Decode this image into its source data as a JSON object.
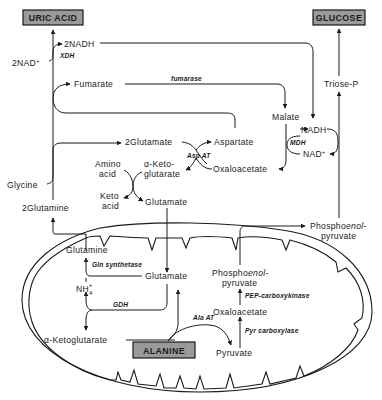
{
  "diagram": {
    "products": {
      "uric_acid": "URIC ACID",
      "glucose": "GLUCOSE",
      "alanine": "ALANINE"
    },
    "cytosol": {
      "nadh_2": "2NADH",
      "nad_2": "2NAD",
      "nad_sup": "+",
      "xdh": "XDH",
      "fumarate": "Fumarate",
      "fumarase": "fumarase",
      "malate": "Malate",
      "triose_p": "Triose-P",
      "nadh": "NADH",
      "mdh": "MDH",
      "nad": "NAD",
      "glutamate_2": "2Glutamate",
      "aspartate": "Aspartate",
      "asp_at": "Asp AT",
      "oxaloacetate": "Oxaloacetate",
      "amino_acid_1": "Amino",
      "amino_acid_2": "acid",
      "alpha_kg_1": "α-Keto-",
      "alpha_kg_2": "glutarate",
      "keto_acid_1": "Keto",
      "keto_acid_2": "acid",
      "glutamate": "Glutamate",
      "glycine": "Glycine",
      "glutamine_2": "2Glutamine",
      "pep_1": "Phospho",
      "pep_enol": "enol",
      "pep_dash": "-",
      "pep_2": "pyruvate"
    },
    "mitochondrion": {
      "glutamine": "Glutamine",
      "gln_synthetase": "Gln synthetase",
      "glutamate": "Glutamate",
      "nh4": "NH",
      "nh4_sub": "4",
      "nh4_sup": "+",
      "gdh": "GDH",
      "alpha_ketoglutarate": "α-Ketoglutarate",
      "ala_at": "Ala AT",
      "pyruvate": "Pyruvate",
      "pyr_carboxylase": "Pyr carboxylase",
      "oxaloacetate": "Oxaloacetate",
      "pep_carboxykinase": "PEP-carboxykinase",
      "pep_1": "Phospho",
      "pep_enol": "enol",
      "pep_dash": "-",
      "pep_2": "pyruvate"
    },
    "colors": {
      "ink": "#1a1a1a",
      "box_fill": "#9a9a9a",
      "background": "#ffffff"
    }
  }
}
